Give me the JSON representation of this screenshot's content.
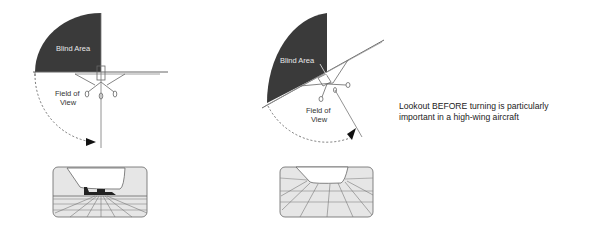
{
  "diagram": {
    "left_panel": {
      "blind_area_label": "Blind Area",
      "field_of_view_label_line1": "Field of",
      "field_of_view_label_line2": "View",
      "state": "level flight"
    },
    "right_panel": {
      "blind_area_label": "Blind Area",
      "field_of_view_label_line1": "Field of",
      "field_of_view_label_line2": "View",
      "state": "banked turn"
    },
    "caption_line1": "Lookout BEFORE turning is particularly",
    "caption_line2": "important in a high-wing aircraft",
    "colors": {
      "blind_area": "#3a3a3a",
      "line": "#555555",
      "window_fill": "#e6e6e6"
    }
  }
}
